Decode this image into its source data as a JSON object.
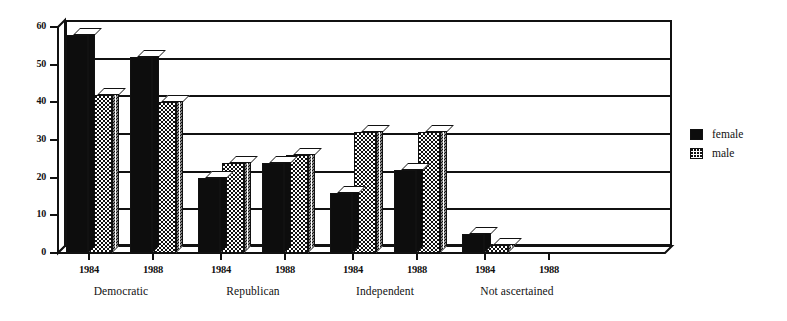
{
  "chart_data": {
    "type": "bar",
    "title": "",
    "subtitle": "",
    "xlabel": "",
    "ylabel": "",
    "ylim": [
      0,
      60
    ],
    "yticks": [
      0,
      10,
      20,
      30,
      40,
      50,
      60
    ],
    "grid": true,
    "legend_position": "right",
    "style_note": "3D grouped bar chart",
    "groups": [
      "Democratic",
      "Republican",
      "Independent",
      "Not ascertained"
    ],
    "subcategories": [
      "1984",
      "1988"
    ],
    "categories": [
      "Democratic 1984",
      "Democratic 1988",
      "Republican 1984",
      "Republican 1988",
      "Independent 1984",
      "Independent 1988",
      "Not ascertained 1984",
      "Not ascertained 1988"
    ],
    "series": [
      {
        "name": "female",
        "fill": "solid-black",
        "color": "#0d0d0d",
        "values": [
          58,
          52,
          20,
          24,
          16,
          22,
          5,
          0
        ]
      },
      {
        "name": "male",
        "fill": "stipple-dots",
        "color": "#ffffff",
        "values": [
          42,
          40,
          24,
          26,
          32,
          32,
          2,
          0
        ]
      }
    ]
  },
  "axis": {
    "y_tick_labels": [
      "60",
      "50",
      "40",
      "30",
      "20",
      "10",
      "0"
    ]
  },
  "xaxis": {
    "groups": [
      {
        "label": "Democratic",
        "years": [
          "1984",
          "1988"
        ]
      },
      {
        "label": "Republican",
        "years": [
          "1984",
          "1988"
        ]
      },
      {
        "label": "Independent",
        "years": [
          "1984",
          "1988"
        ]
      },
      {
        "label": "Not ascertained",
        "years": [
          "1984",
          "1988"
        ]
      }
    ]
  },
  "legend": {
    "items": [
      {
        "label": "female",
        "swatch": "solid-black-square"
      },
      {
        "label": "male",
        "swatch": "stippled-square"
      }
    ]
  }
}
